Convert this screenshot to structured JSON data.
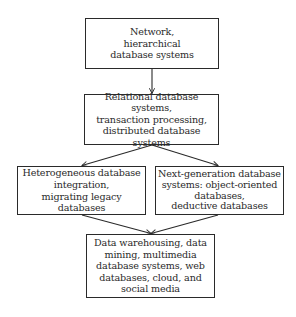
{
  "diagram": {
    "type": "flowchart",
    "colors": {
      "stroke": "#2a2a2a",
      "text": "#2a2a2a",
      "background": "#ffffff"
    },
    "nodes": [
      {
        "id": "n1",
        "label": "Network,\nhierarchical\ndatabase systems"
      },
      {
        "id": "n2",
        "label": "Relational database systems,\ntransaction processing,\ndistributed database systems"
      },
      {
        "id": "n3",
        "label": "Heterogeneous database\nintegration,\nmigrating legacy databases"
      },
      {
        "id": "n4",
        "label": "Next-generation database\nsystems: object-oriented\ndatabases,\ndeductive databases"
      },
      {
        "id": "n5",
        "label": "Data warehousing, data\nmining, multimedia\ndatabase systems, web\ndatabases, cloud, and\nsocial media"
      }
    ],
    "edges": [
      {
        "from": "n1",
        "to": "n2"
      },
      {
        "from": "n2",
        "to": "n3"
      },
      {
        "from": "n2",
        "to": "n4"
      },
      {
        "from": "n3",
        "to": "n5"
      },
      {
        "from": "n4",
        "to": "n5"
      }
    ]
  }
}
